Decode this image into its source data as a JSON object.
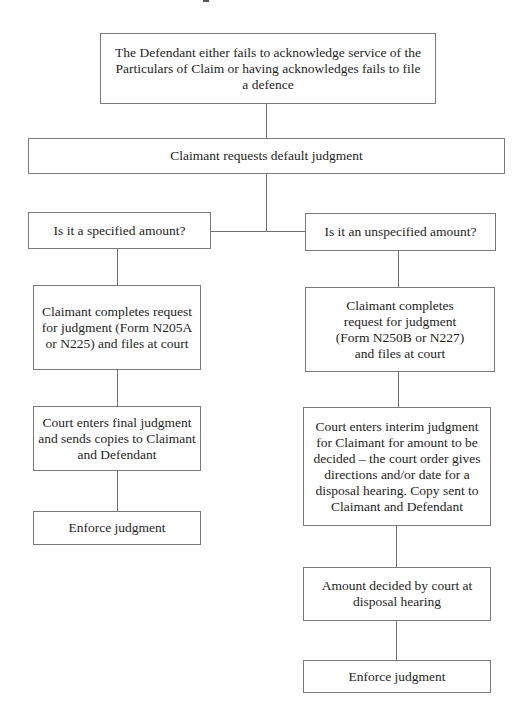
{
  "diagram": {
    "type": "flowchart",
    "nodes": {
      "start": "The Defendant either fails to acknowledge service of the Particulars of Claim or having acknowledges fails to file a defence",
      "request": "Claimant requests default judgment",
      "specified_question": "Is it a specified amount?",
      "unspecified_question": "Is it an unspecified amount?",
      "specified_form": "Claimant completes request for judgment (Form N205A or N225) and files at court",
      "unspecified_form": "Claimant completes request for judgment (Form N250B or N227) and files at court",
      "final_judgment": "Court enters final judgment and sends copies to Claimant and Defendant",
      "interim_judgment": "Court enters interim judgment for Claimant for amount to be decided – the court order gives directions and/or date for a disposal hearing. Copy sent to Claimant and Defendant",
      "specified_enforce": "Enforce judgment",
      "amount_decided": "Amount decided by court at disposal hearing",
      "unspecified_enforce": "Enforce judgment"
    },
    "edges": [
      [
        "start",
        "request"
      ],
      [
        "request",
        "specified_question"
      ],
      [
        "request",
        "unspecified_question"
      ],
      [
        "specified_question",
        "specified_form"
      ],
      [
        "specified_form",
        "final_judgment"
      ],
      [
        "final_judgment",
        "specified_enforce"
      ],
      [
        "unspecified_question",
        "unspecified_form"
      ],
      [
        "unspecified_form",
        "interim_judgment"
      ],
      [
        "interim_judgment",
        "amount_decided"
      ],
      [
        "amount_decided",
        "unspecified_enforce"
      ]
    ]
  }
}
